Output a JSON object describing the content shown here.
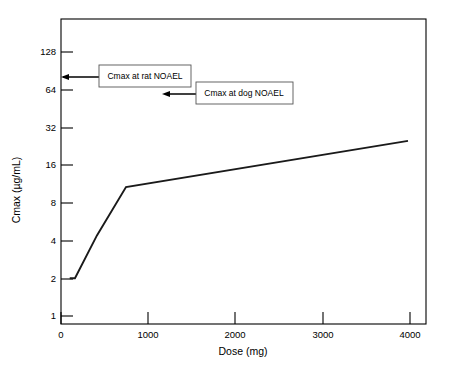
{
  "chart_data": {
    "type": "line",
    "title": "",
    "xlabel": "Dose (mg)",
    "ylabel": "Cmax (µg/mL)",
    "xlim": [
      0,
      4400
    ],
    "ylim": [
      1,
      256
    ],
    "yscale": "log2",
    "grid": false,
    "legend": "none",
    "xticks": [
      0,
      1000,
      2000,
      3000,
      4000
    ],
    "xtick_labels": [
      "0",
      "1000",
      "2000",
      "3000",
      "4000"
    ],
    "yticks": [
      1,
      2,
      4,
      8,
      16,
      32,
      64,
      128
    ],
    "ytick_labels": [
      "1",
      "2",
      "4",
      "8",
      "16",
      "32",
      "64",
      "128"
    ],
    "series": [
      {
        "name": "Cmax",
        "x": [
          100,
          160,
          412,
          745,
          3977
        ],
        "y": [
          2.0,
          2.0,
          4.4,
          10.7,
          25.0
        ]
      }
    ],
    "annotations": [
      {
        "label": "Cmax at rat NOAEL",
        "target_x": 0,
        "target_y": 80,
        "box_x": 1000,
        "box_y": 80
      },
      {
        "label": "Cmax at dog NOAEL",
        "target_x": 1180,
        "target_y": 59,
        "box_x": 2280,
        "box_y": 59
      }
    ]
  },
  "axes": {
    "x_title": "Dose (mg)",
    "y_title": "Cmax (µg/mL)"
  },
  "ticks": {
    "x": [
      "0",
      "1000",
      "2000",
      "3000",
      "4000"
    ],
    "y": [
      "1",
      "2",
      "4",
      "8",
      "16",
      "32",
      "64",
      "128"
    ]
  },
  "annotations": {
    "rat": "Cmax at rat NOAEL",
    "dog": "Cmax at dog NOAEL"
  },
  "colors": {
    "background": "#ffffff",
    "axis": "#000000",
    "series": "#1a1a1a",
    "annotation_border": "#555555"
  }
}
